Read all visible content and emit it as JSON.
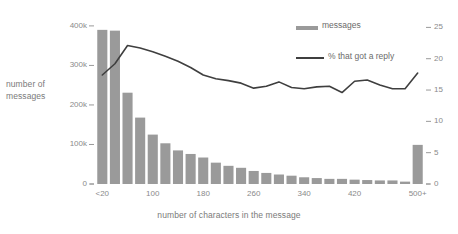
{
  "chart": {
    "type": "bar-line-combo",
    "ylabel_left": "number of\nmessages",
    "ylabel_left_line1": "number of",
    "ylabel_left_line2": "messages",
    "xlabel": "number of characters in the message",
    "legend": [
      {
        "label": "messages",
        "kind": "bar-swatch",
        "color": "#9a9a9a"
      },
      {
        "label": "% that got a reply",
        "kind": "line",
        "color": "#3f3f3f"
      }
    ],
    "yticks_left": [
      "0",
      "100k",
      "200k",
      "300k",
      "400k"
    ],
    "yticks_right": [
      "0",
      "5",
      "10",
      "15",
      "20",
      "25"
    ],
    "xticks": [
      "<20",
      "100",
      "180",
      "260",
      "340",
      "420",
      "500+"
    ]
  },
  "chart_data": {
    "type": "bar",
    "title": "",
    "xlabel": "number of characters in the message",
    "ylabel": "number of messages",
    "ylabel_secondary": "% that got a reply",
    "grid": false,
    "legend_position": "top-right",
    "ylim": [
      0,
      420000
    ],
    "ylim_secondary": [
      0,
      26.5
    ],
    "categories": [
      "<20",
      "20-39",
      "40-59",
      "60-79",
      "80-99",
      "100-119",
      "120-139",
      "140-159",
      "160-179",
      "180-199",
      "200-219",
      "220-239",
      "240-259",
      "260-279",
      "280-299",
      "300-319",
      "320-339",
      "340-359",
      "360-379",
      "380-399",
      "400-419",
      "420-439",
      "440-459",
      "460-479",
      "480-499",
      "500+"
    ],
    "xtick_labels": [
      "<20",
      "100",
      "180",
      "260",
      "340",
      "420",
      "500+"
    ],
    "xtick_positions": [
      0,
      4,
      8,
      12,
      16,
      20,
      25
    ],
    "ytick_labels_left": [
      "0",
      "100k",
      "200k",
      "300k",
      "400k"
    ],
    "ytick_values_left": [
      0,
      100000,
      200000,
      300000,
      400000
    ],
    "ytick_labels_right": [
      "0",
      "5",
      "10",
      "15",
      "20",
      "25"
    ],
    "ytick_values_right": [
      0,
      5,
      10,
      15,
      20,
      25
    ],
    "series": [
      {
        "name": "messages",
        "kind": "bar",
        "axis": "left",
        "color": "#9a9a9a",
        "values": [
          390000,
          388000,
          231000,
          168000,
          125000,
          103000,
          85000,
          76000,
          67000,
          54000,
          46000,
          41000,
          33000,
          28000,
          24000,
          21000,
          17000,
          15000,
          13000,
          13000,
          11000,
          10000,
          9000,
          9000,
          6000,
          99000
        ]
      },
      {
        "name": "% that got a reply",
        "kind": "line",
        "axis": "right",
        "color": "#3f3f3f",
        "values": [
          17.4,
          19.2,
          22.1,
          21.7,
          21.1,
          20.4,
          19.6,
          18.6,
          17.4,
          16.8,
          16.5,
          16.1,
          15.3,
          15.6,
          16.3,
          15.4,
          15.2,
          15.5,
          15.6,
          14.6,
          16.4,
          16.6,
          15.8,
          15.2,
          15.2,
          17.7
        ]
      }
    ]
  }
}
